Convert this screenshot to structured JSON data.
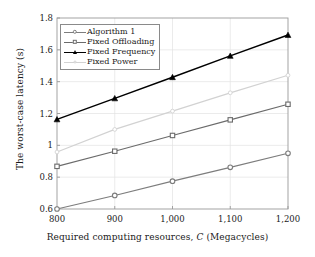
{
  "chart_data": {
    "type": "line",
    "title": "",
    "xlabel": "Required computing resources, C (Megacycles)",
    "xlabel_prefix": "Required computing resources,",
    "xlabel_symbol": "C",
    "xlabel_suffix": "(Megacycles)",
    "ylabel": "The worst-case latency (s)",
    "x": [
      800,
      900,
      1000,
      1100,
      1200
    ],
    "xtick_labels": [
      "800",
      "900",
      "1,000",
      "1,100",
      "1,200"
    ],
    "ytick_labels": [
      "0.6",
      "0.8",
      "1",
      "1.2",
      "1.4",
      "1.6",
      "1.8"
    ],
    "ytick_values": [
      0.6,
      0.8,
      1.0,
      1.2,
      1.4,
      1.6,
      1.8
    ],
    "xlim": [
      800,
      1200
    ],
    "ylim": [
      0.6,
      1.8
    ],
    "grid": true,
    "legend_position": "top-left",
    "series": [
      {
        "name": "Algorithm 1",
        "values": [
          0.6,
          0.685,
          0.775,
          0.862,
          0.95
        ],
        "color": "#7d7d7d",
        "marker": "circle",
        "marker_name": "circle-marker"
      },
      {
        "name": "Fixed Offloading",
        "values": [
          0.868,
          0.963,
          1.062,
          1.16,
          1.258
        ],
        "color": "#6b6b6b",
        "marker": "square",
        "marker_name": "square-marker"
      },
      {
        "name": "Fixed Frequency",
        "values": [
          1.163,
          1.295,
          1.428,
          1.562,
          1.693
        ],
        "color": "#000000",
        "marker": "triangle",
        "marker_name": "triangle-marker"
      },
      {
        "name": "Fixed Power",
        "values": [
          0.958,
          1.1,
          1.215,
          1.33,
          1.44
        ],
        "color": "#d2d2d2",
        "marker": "circle-small",
        "marker_name": "small-circle-marker"
      }
    ]
  },
  "axes": {
    "frame_color": "#9a9a9a",
    "grid_color": "#e2e2e2",
    "background": "#ffffff"
  }
}
